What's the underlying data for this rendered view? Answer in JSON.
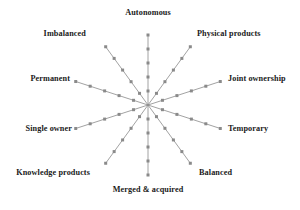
{
  "chart_data": {
    "type": "radar",
    "title": "",
    "subtitle": "",
    "xlabel": "",
    "ylabel": "",
    "legend_position": "none",
    "grid": false,
    "axis_count": 10,
    "ticks_per_axis": 5,
    "tick_marker": "square",
    "center": {
      "x": 148,
      "y": 105
    },
    "categories": [
      "Autonomous",
      "Physical products",
      "Joint ownership",
      "Temporary",
      "Balanced",
      "Merged & acquired",
      "Knowledge products",
      "Single owner",
      "Permanent",
      "Imbalanced"
    ],
    "axes": [
      {
        "label": "Autonomous",
        "angle_deg": 90,
        "length": 70,
        "label_x": 148,
        "label_y": 8,
        "label_anchor": "center"
      },
      {
        "label": "Physical products",
        "angle_deg": 54,
        "length": 72,
        "label_x": 197,
        "label_y": 29,
        "label_anchor": "left"
      },
      {
        "label": "Joint ownership",
        "angle_deg": 18,
        "length": 76,
        "label_x": 228,
        "label_y": 74,
        "label_anchor": "left"
      },
      {
        "label": "Temporary",
        "angle_deg": -18,
        "length": 76,
        "label_x": 228,
        "label_y": 124,
        "label_anchor": "left"
      },
      {
        "label": "Balanced",
        "angle_deg": -54,
        "length": 72,
        "label_x": 199,
        "label_y": 168,
        "label_anchor": "left"
      },
      {
        "label": "Merged & acquired",
        "angle_deg": -90,
        "length": 70,
        "label_x": 148,
        "label_y": 185,
        "label_anchor": "center"
      },
      {
        "label": "Knowledge products",
        "angle_deg": -126,
        "length": 72,
        "label_x": 90,
        "label_y": 168,
        "label_anchor": "right"
      },
      {
        "label": "Single owner",
        "angle_deg": -162,
        "length": 76,
        "label_x": 72,
        "label_y": 124,
        "label_anchor": "right"
      },
      {
        "label": "Permanent",
        "angle_deg": 162,
        "length": 76,
        "label_x": 70,
        "label_y": 74,
        "label_anchor": "right"
      },
      {
        "label": "Imbalanced",
        "angle_deg": 126,
        "length": 72,
        "label_x": 86,
        "label_y": 29,
        "label_anchor": "right"
      }
    ],
    "colors": {
      "axis_line": "#8a8a8a",
      "tick_marker": "#8a8a8a",
      "label_text": "#1a1a1a",
      "background": "#ffffff"
    }
  }
}
